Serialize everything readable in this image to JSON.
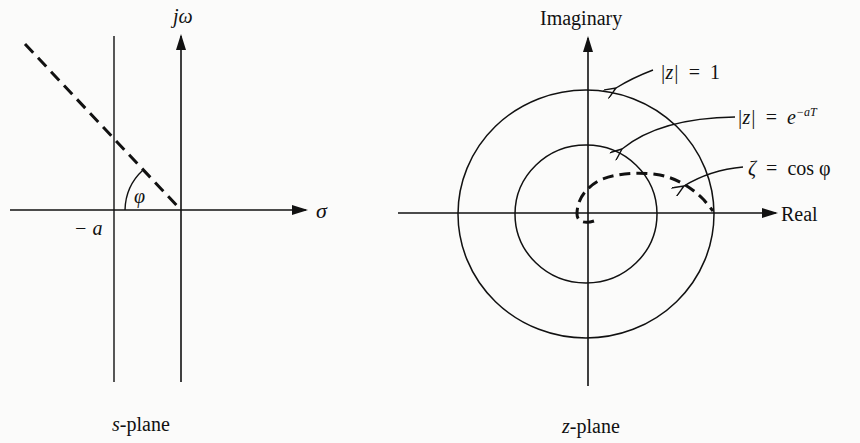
{
  "s_plane": {
    "caption_var": "s",
    "caption_rest": "-plane",
    "vertical_axis_label": "jω",
    "horizontal_axis_label": "σ",
    "offset_label": "− a",
    "angle_label": "φ"
  },
  "z_plane": {
    "caption_var": "z",
    "caption_rest": "-plane",
    "vertical_axis_label": "Imaginary",
    "horizontal_axis_label": "Real",
    "annotations": [
      {
        "lhs": "|z|",
        "eq": "=",
        "rhs": "1"
      },
      {
        "lhs": "|z|",
        "eq": "=",
        "rhs_base": "e",
        "rhs_exp": "−aT"
      },
      {
        "lhs": "ζ",
        "eq": "=",
        "rhs": "cos φ"
      }
    ]
  },
  "colors": {
    "ink": "#111111",
    "paper": "#fbfbfa"
  }
}
